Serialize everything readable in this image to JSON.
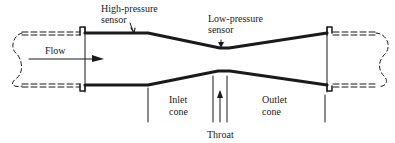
{
  "diagram": {
    "labels": {
      "high_pressure_sensor_line1": "High-pressure",
      "high_pressure_sensor_line2": "sensor",
      "low_pressure_sensor_line1": "Low-pressure",
      "low_pressure_sensor_line2": "sensor",
      "flow": "Flow",
      "inlet_cone_line1": "Inlet",
      "inlet_cone_line2": "cone",
      "throat": "Throat",
      "outlet_cone_line1": "Outlet",
      "outlet_cone_line2": "cone"
    },
    "colors": {
      "stroke": "#1a1a1a",
      "background": "#ffffff"
    }
  }
}
